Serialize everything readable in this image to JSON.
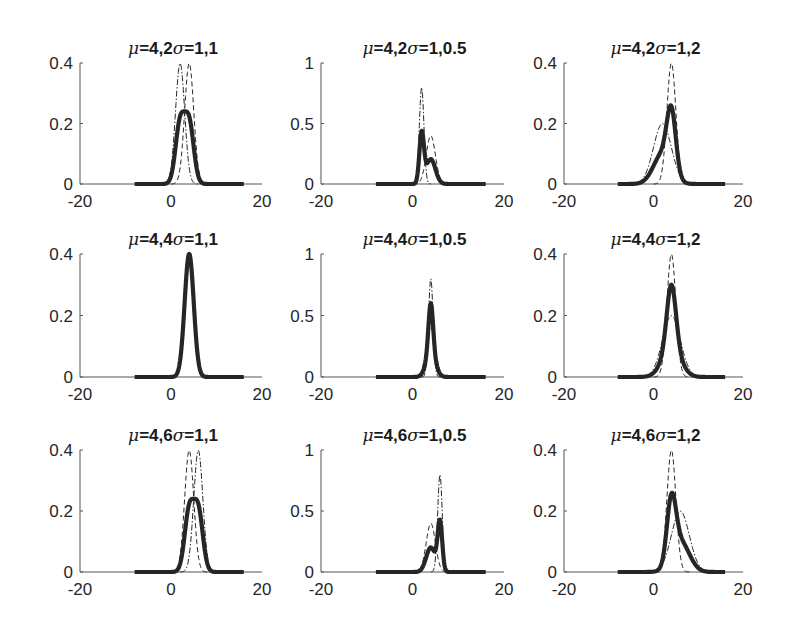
{
  "figure": {
    "layout": {
      "rows": 3,
      "cols": 3
    },
    "line_color": "#262626",
    "axis_color": "#555555",
    "ghost_color": "#e6e6e6"
  },
  "chart_data": [
    {
      "type": "line",
      "row": 0,
      "col": 0,
      "title": "μ=4,2σ=1,1",
      "title_parts": {
        "mu": "μ",
        "mu_vals": "=4,2",
        "sigma": "σ",
        "sigma_vals": "=1,1"
      },
      "mus": [
        4,
        2
      ],
      "sigmas": [
        1,
        1
      ],
      "xlim": [
        -20,
        20
      ],
      "ylim": [
        0,
        0.4
      ],
      "xticks": [
        -20,
        0,
        20
      ],
      "yticks": [
        0,
        0.2,
        0.4
      ],
      "xtick_labels": [
        "-20",
        "0",
        "20"
      ],
      "ytick_labels": [
        "0",
        "0.2",
        "0.4"
      ],
      "series": [
        {
          "name": "mixture",
          "style": "solid-bold",
          "peak_x": 3,
          "peak_y": 0.24
        },
        {
          "name": "component-1",
          "style": "dash-dot",
          "peak_x": 2,
          "peak_y": 0.4
        },
        {
          "name": "component-2",
          "style": "dashed",
          "peak_x": 4,
          "peak_y": 0.4
        }
      ]
    },
    {
      "type": "line",
      "row": 0,
      "col": 1,
      "title": "μ=4,2σ=1,0.5",
      "title_parts": {
        "mu": "μ",
        "mu_vals": "=4,2",
        "sigma": "σ",
        "sigma_vals": "=1,0.5"
      },
      "mus": [
        4,
        2
      ],
      "sigmas": [
        1,
        0.5
      ],
      "xlim": [
        -20,
        20
      ],
      "ylim": [
        0,
        1
      ],
      "xticks": [
        -20,
        0,
        20
      ],
      "yticks": [
        0,
        0.5,
        1
      ],
      "xtick_labels": [
        "-20",
        "0",
        "20"
      ],
      "ytick_labels": [
        "0",
        "0.5",
        "1"
      ],
      "series": [
        {
          "name": "mixture",
          "style": "solid-bold",
          "peak_x": 2,
          "peak_y": 0.44
        },
        {
          "name": "component-1",
          "style": "dash-dot",
          "peak_x": 2,
          "peak_y": 0.8
        },
        {
          "name": "component-2",
          "style": "dashed",
          "peak_x": 4,
          "peak_y": 0.4
        }
      ]
    },
    {
      "type": "line",
      "row": 0,
      "col": 2,
      "title": "μ=4,2σ=1,2",
      "title_parts": {
        "mu": "μ",
        "mu_vals": "=4,2",
        "sigma": "σ",
        "sigma_vals": "=1,2"
      },
      "mus": [
        4,
        2
      ],
      "sigmas": [
        1,
        2
      ],
      "xlim": [
        -20,
        20
      ],
      "ylim": [
        0,
        0.4
      ],
      "xticks": [
        -20,
        0,
        20
      ],
      "yticks": [
        0,
        0.2,
        0.4
      ],
      "xtick_labels": [
        "-20",
        "0",
        "20"
      ],
      "ytick_labels": [
        "0",
        "0.2",
        "0.4"
      ],
      "series": [
        {
          "name": "mixture",
          "style": "solid-bold",
          "peak_x": 4,
          "peak_y": 0.26
        },
        {
          "name": "component-1",
          "style": "dashed",
          "peak_x": 4,
          "peak_y": 0.4
        },
        {
          "name": "component-2",
          "style": "dash-dot",
          "peak_x": 2,
          "peak_y": 0.2
        }
      ]
    },
    {
      "type": "line",
      "row": 1,
      "col": 0,
      "title": "μ=4,4σ=1,1",
      "title_parts": {
        "mu": "μ",
        "mu_vals": "=4,4",
        "sigma": "σ",
        "sigma_vals": "=1,1"
      },
      "mus": [
        4,
        4
      ],
      "sigmas": [
        1,
        1
      ],
      "xlim": [
        -20,
        20
      ],
      "ylim": [
        0,
        0.4
      ],
      "xticks": [
        -20,
        0,
        20
      ],
      "yticks": [
        0,
        0.2,
        0.4
      ],
      "xtick_labels": [
        "-20",
        "0",
        "20"
      ],
      "ytick_labels": [
        "0",
        "0.2",
        "0.4"
      ],
      "series": [
        {
          "name": "mixture",
          "style": "solid-bold",
          "peak_x": 4,
          "peak_y": 0.4
        },
        {
          "name": "component-1",
          "style": "dash-dot",
          "peak_x": 4,
          "peak_y": 0.4
        },
        {
          "name": "component-2",
          "style": "dashed",
          "peak_x": 4,
          "peak_y": 0.4
        }
      ]
    },
    {
      "type": "line",
      "row": 1,
      "col": 1,
      "title": "μ=4,4σ=1,0.5",
      "title_parts": {
        "mu": "μ",
        "mu_vals": "=4,4",
        "sigma": "σ",
        "sigma_vals": "=1,0.5"
      },
      "mus": [
        4,
        4
      ],
      "sigmas": [
        1,
        0.5
      ],
      "xlim": [
        -20,
        20
      ],
      "ylim": [
        0,
        1
      ],
      "xticks": [
        -20,
        0,
        20
      ],
      "yticks": [
        0,
        0.5,
        1
      ],
      "xtick_labels": [
        "-20",
        "0",
        "20"
      ],
      "ytick_labels": [
        "0",
        "0.5",
        "1"
      ],
      "series": [
        {
          "name": "mixture",
          "style": "solid-bold",
          "peak_x": 4,
          "peak_y": 0.6
        },
        {
          "name": "component-1",
          "style": "dash-dot",
          "peak_x": 4,
          "peak_y": 0.8
        },
        {
          "name": "component-2",
          "style": "dashed",
          "peak_x": 4,
          "peak_y": 0.4
        }
      ]
    },
    {
      "type": "line",
      "row": 1,
      "col": 2,
      "title": "μ=4,4σ=1,2",
      "title_parts": {
        "mu": "μ",
        "mu_vals": "=4,4",
        "sigma": "σ",
        "sigma_vals": "=1,2"
      },
      "mus": [
        4,
        4
      ],
      "sigmas": [
        1,
        2
      ],
      "xlim": [
        -20,
        20
      ],
      "ylim": [
        0,
        0.4
      ],
      "xticks": [
        -20,
        0,
        20
      ],
      "yticks": [
        0,
        0.2,
        0.4
      ],
      "xtick_labels": [
        "-20",
        "0",
        "20"
      ],
      "ytick_labels": [
        "0",
        "0.2",
        "0.4"
      ],
      "series": [
        {
          "name": "mixture",
          "style": "solid-bold",
          "peak_x": 4,
          "peak_y": 0.3
        },
        {
          "name": "component-1",
          "style": "dashed",
          "peak_x": 4,
          "peak_y": 0.4
        },
        {
          "name": "component-2",
          "style": "dash-dot",
          "peak_x": 4,
          "peak_y": 0.2
        }
      ]
    },
    {
      "type": "line",
      "row": 2,
      "col": 0,
      "title": "μ=4,6σ=1,1",
      "title_parts": {
        "mu": "μ",
        "mu_vals": "=4,6",
        "sigma": "σ",
        "sigma_vals": "=1,1"
      },
      "mus": [
        4,
        6
      ],
      "sigmas": [
        1,
        1
      ],
      "xlim": [
        -20,
        20
      ],
      "ylim": [
        0,
        0.4
      ],
      "xticks": [
        -20,
        0,
        20
      ],
      "yticks": [
        0,
        0.2,
        0.4
      ],
      "xtick_labels": [
        "-20",
        "0",
        "20"
      ],
      "ytick_labels": [
        "0",
        "0.2",
        "0.4"
      ],
      "series": [
        {
          "name": "mixture",
          "style": "solid-bold",
          "peak_x": 5,
          "peak_y": 0.24
        },
        {
          "name": "component-1",
          "style": "dashed",
          "peak_x": 4,
          "peak_y": 0.4
        },
        {
          "name": "component-2",
          "style": "dash-dot",
          "peak_x": 6,
          "peak_y": 0.4
        }
      ]
    },
    {
      "type": "line",
      "row": 2,
      "col": 1,
      "title": "μ=4,6σ=1,0.5",
      "title_parts": {
        "mu": "μ",
        "mu_vals": "=4,6",
        "sigma": "σ",
        "sigma_vals": "=1,0.5"
      },
      "mus": [
        4,
        6
      ],
      "sigmas": [
        1,
        0.5
      ],
      "xlim": [
        -20,
        20
      ],
      "ylim": [
        0,
        1
      ],
      "xticks": [
        -20,
        0,
        20
      ],
      "yticks": [
        0,
        0.5,
        1
      ],
      "xtick_labels": [
        "-20",
        "0",
        "20"
      ],
      "ytick_labels": [
        "0",
        "0.5",
        "1"
      ],
      "series": [
        {
          "name": "mixture",
          "style": "solid-bold",
          "peak_x": 6,
          "peak_y": 0.43
        },
        {
          "name": "component-1",
          "style": "dashed",
          "peak_x": 4,
          "peak_y": 0.4
        },
        {
          "name": "component-2",
          "style": "dash-dot",
          "peak_x": 6,
          "peak_y": 0.8
        }
      ]
    },
    {
      "type": "line",
      "row": 2,
      "col": 2,
      "title": "μ=4,6σ=1,2",
      "title_parts": {
        "mu": "μ",
        "mu_vals": "=4,6",
        "sigma": "σ",
        "sigma_vals": "=1,2"
      },
      "mus": [
        4,
        6
      ],
      "sigmas": [
        1,
        2
      ],
      "xlim": [
        -20,
        20
      ],
      "ylim": [
        0,
        0.4
      ],
      "xticks": [
        -20,
        0,
        20
      ],
      "yticks": [
        0,
        0.2,
        0.4
      ],
      "xtick_labels": [
        "-20",
        "0",
        "20"
      ],
      "ytick_labels": [
        "0",
        "0.2",
        "0.4"
      ],
      "series": [
        {
          "name": "mixture",
          "style": "solid-bold",
          "peak_x": 4.5,
          "peak_y": 0.26
        },
        {
          "name": "component-1",
          "style": "dashed",
          "peak_x": 4,
          "peak_y": 0.4
        },
        {
          "name": "component-2",
          "style": "dash-dot",
          "peak_x": 6,
          "peak_y": 0.2
        }
      ]
    }
  ]
}
